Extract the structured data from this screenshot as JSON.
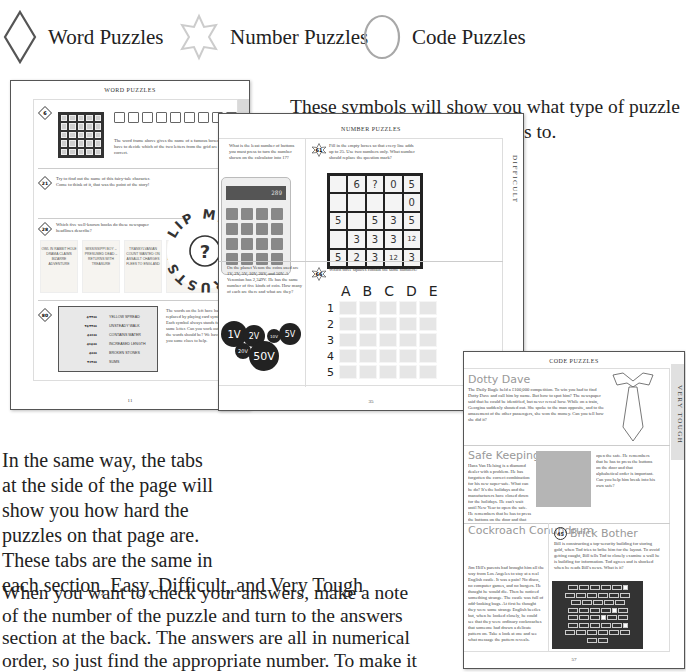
{
  "legend": {
    "items": [
      {
        "icon": "diamond-icon",
        "label": "Word Puzzles",
        "color": "#555555"
      },
      {
        "icon": "star-icon",
        "label": "Number Puzzles",
        "color": "#cccccc"
      },
      {
        "icon": "circle-icon",
        "label": "Code Puzzles",
        "color": "#a8a8a8"
      }
    ]
  },
  "intro_text": {
    "line1": "These symbols will show you what type of puzzle",
    "line2": "the question or answer belongs to."
  },
  "tabs_text": {
    "lines": [
      "In the same way, the tabs",
      "at the side of the page will",
      "show you how hard the",
      "puzzles on that page are.",
      "These tabs are the same in",
      "each section, Easy, Difficult, and Very Tough"
    ]
  },
  "answers_text": {
    "lines": [
      "When you want to check your answers, make a note",
      "of the number of the puzzle and turn to the answers",
      "section at the back. The answers are all in numerical",
      "order, so just find the appropriate number. To make it"
    ]
  },
  "pages": {
    "word": {
      "title": "WORD PUZZLES",
      "tab": "EASY",
      "page_number": "11",
      "puzzles": [
        {
          "number": "6",
          "text": "The word frame above gives the name of a famous boxer. You have to decide which of the two letters from the grid are correct."
        },
        {
          "number": "21",
          "text": "Try to find out the name of this fairy-tale character. Come to think of it, that was the point of the story!"
        },
        {
          "number": "28",
          "text": "Which five well-known books do these newspaper headlines describe?"
        },
        {
          "number": "80",
          "text": "The words on the left have had letters replaced by playing card symbols. Each symbol always stands for the same letter. Can you work out what the words should be? We have given you some clues to help."
        }
      ],
      "circle_words": "LIP MILK ENTRUSTS",
      "circle_center": "?",
      "grid_cols": [
        "A",
        "B",
        "C",
        "D",
        "E"
      ],
      "grid_rows": [
        "1",
        "2",
        "3",
        "4",
        "5"
      ],
      "headlines": [
        "OWL IN RABBIT HOLE DRAMA CLAIMS BIZARRE ADVENTURE",
        "MISSISSIPPI BOY – PRESUMED DEAD – RETURNS WITH TREASURE",
        "TRANSYLVANIAN COUNT WANTED ON ASSAULT CHARGES FLEES TO ENGLAND",
        "MARINER CLAIMS STRANGE ADVENTURE AMONG TINY PEOPLE",
        "SMALL BOY IN WEIRD TRANSFORMATION SHOCKING MIDNIGHT ALLEGATION"
      ],
      "card_clues": [
        "YELLOW SPREAD",
        "UNSTEADY WALK",
        "CONTAINS WATER",
        "INCREASED LENGTH",
        "BROKEN STONES",
        "SUMS"
      ]
    },
    "number": {
      "title": "NUMBER PUZZLES",
      "tab": "DIFFICULT",
      "page_number": "35",
      "puzzles": [
        {
          "number": "",
          "text": "What is the least number of buttons you must press to turn the number shown on the calculator into 17?"
        },
        {
          "number": "61",
          "text": "Fill in the empty boxes so that every line adds up to 25. Use two numbers only. What number should replace the question mark?"
        },
        {
          "number": "66",
          "text": "Which three squares contain the same numbers?"
        },
        {
          "number": "",
          "text": "On the planet Venon the coins used are 1V, 2V, 5V, 10V, 20V, and 50V. A Venonian has 2,349V. He has the same number of five kinds of coin. How many of each are there and what are they?"
        }
      ],
      "calculator_display": "289",
      "grid": [
        [
          "",
          "6",
          "?",
          "0",
          "5"
        ],
        [
          "",
          "",
          "",
          "",
          "0"
        ],
        [
          "5",
          "",
          "5",
          "3",
          "5"
        ],
        [
          "",
          "3",
          "3",
          "3",
          "12"
        ],
        [
          "5",
          "2",
          "3",
          "12",
          "3"
        ]
      ],
      "letter_cols": [
        "A",
        "B",
        "C",
        "D",
        "E"
      ],
      "letter_rows": [
        "1",
        "2",
        "3",
        "4",
        "5"
      ],
      "coins": [
        "1V",
        "2V",
        "10V",
        "5V",
        "20V",
        "50V"
      ]
    },
    "code": {
      "title": "CODE PUZZLES",
      "tab": "VERY TOUGH",
      "page_number": "57",
      "puzzles": [
        {
          "heading": "Dotty Dave",
          "text": "The Daily Bugle held a £100,000 competition. To win you had to find Dotty Dave and call him by name. But how to spot him? The newspaper said that he could be identified, but never reveal how. While on a train, Georgina suddenly shouted out. She spoke to the man opposite, and to the amazement of the other passengers, she won the money. Can you tell how she did it?"
        },
        {
          "heading": "Safe Keeping",
          "text": "Hans Van Helsing is a diamond dealer with a problem. He has forgotten the correct combination for his new super-safe. What can he do? It's the holidays and the manufacturers have closed down for the holidays. He can't wait until New Year to open the safe. He remembers that he has to press the buttons on the door and that alphabetical order is important. Can you help him break into his own safe?"
        },
        {
          "heading": "Cockroach Conundrum",
          "text": "Jim Hill's parents had brought him all the way from Los Angeles to stay at a real English castle. It was a pain! No disco, no computer games, and no burgers. He thought he would die. Then he noticed something strange. The castle was full of odd-looking bugs. At first he thought they were some strange English beetles but, when he looked closely, he could see that they were ordinary cockroaches that someone had drawn a delicate pattern on. Take a look at one and see what message the pattern reveals."
        },
        {
          "number": "45",
          "heading": "Brick Bother",
          "text": "Bill is constructing a top-security building for storing gold, when Tod tries to bribe him for the layout. To avoid getting caught, Bill tells Tod to closely examine a wall he is building for information. Tod agrees and is shocked when he reads Bill's news. What is it?"
        }
      ]
    }
  }
}
